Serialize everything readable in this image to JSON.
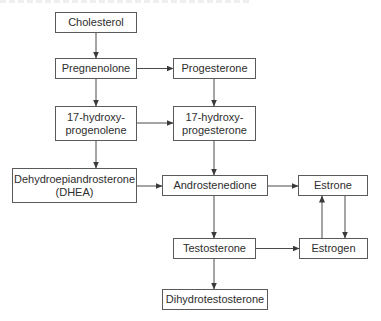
{
  "diagram": {
    "type": "flowchart",
    "title": "",
    "nodes": [
      {
        "id": "cholesterol",
        "label": "Cholesterol"
      },
      {
        "id": "pregnenolone",
        "label": "Pregnenolone"
      },
      {
        "id": "progesterone",
        "label": "Progesterone"
      },
      {
        "id": "hydroxy_progenolene",
        "label_line1": "17-hydroxy-",
        "label_line2": "progenolene"
      },
      {
        "id": "hydroxy_progesterone",
        "label_line1": "17-hydroxy-",
        "label_line2": "progesterone"
      },
      {
        "id": "dhea",
        "label_line1": "Dehydroepiandrosterone",
        "label_line2": "(DHEA)"
      },
      {
        "id": "androstenedione",
        "label": "Androstenedione"
      },
      {
        "id": "estrone",
        "label": "Estrone"
      },
      {
        "id": "testosterone",
        "label": "Testosterone"
      },
      {
        "id": "estrogen",
        "label": "Estrogen"
      },
      {
        "id": "dihydrotestosterone",
        "label": "Dihydrotestosterone"
      }
    ],
    "edges": [
      {
        "from": "cholesterol",
        "to": "pregnenolone"
      },
      {
        "from": "pregnenolone",
        "to": "progesterone"
      },
      {
        "from": "pregnenolone",
        "to": "hydroxy_progenolene"
      },
      {
        "from": "progesterone",
        "to": "hydroxy_progesterone"
      },
      {
        "from": "hydroxy_progenolene",
        "to": "hydroxy_progesterone"
      },
      {
        "from": "hydroxy_progenolene",
        "to": "dhea"
      },
      {
        "from": "hydroxy_progesterone",
        "to": "androstenedione"
      },
      {
        "from": "dhea",
        "to": "androstenedione"
      },
      {
        "from": "androstenedione",
        "to": "estrone"
      },
      {
        "from": "androstenedione",
        "to": "testosterone"
      },
      {
        "from": "testosterone",
        "to": "estrogen"
      },
      {
        "from": "estrogen",
        "to": "estrone"
      },
      {
        "from": "estrone",
        "to": "estrogen"
      },
      {
        "from": "testosterone",
        "to": "dihydrotestosterone"
      }
    ]
  },
  "colors": {
    "border": "#5a5a5a",
    "text": "#2e2e2e",
    "arrow": "#4a4a4a",
    "background": "#ffffff"
  }
}
